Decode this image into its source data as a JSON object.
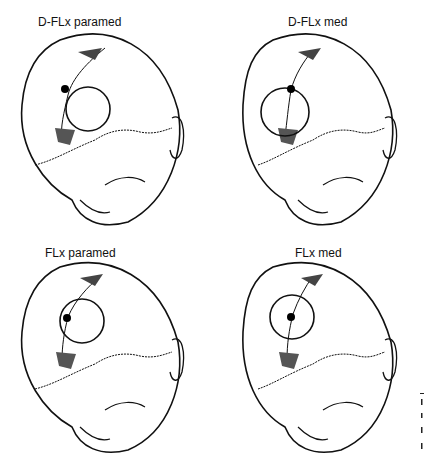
{
  "figure": {
    "panels": [
      {
        "id": "d-flx-paramed",
        "label": "D-FLx paramed",
        "circle": {
          "cx": 88,
          "cy": 109,
          "r": 22
        },
        "dot": {
          "cx": 65,
          "cy": 89
        }
      },
      {
        "id": "d-flx-med",
        "label": "D-FLx med",
        "circle": {
          "cx": 72,
          "cy": 112,
          "r": 24
        },
        "dot": {
          "cx": 78,
          "cy": 89
        }
      },
      {
        "id": "flx-paramed",
        "label": "FLx paramed",
        "circle": {
          "cx": 82,
          "cy": 89,
          "r": 22
        },
        "dot": {
          "cx": 67,
          "cy": 86
        }
      },
      {
        "id": "flx-med",
        "label": "FLx med",
        "circle": {
          "cx": 79,
          "cy": 85,
          "r": 22
        },
        "dot": {
          "cx": 78,
          "cy": 85
        }
      }
    ],
    "colors": {
      "line": "#111111",
      "background": "#ffffff"
    }
  }
}
